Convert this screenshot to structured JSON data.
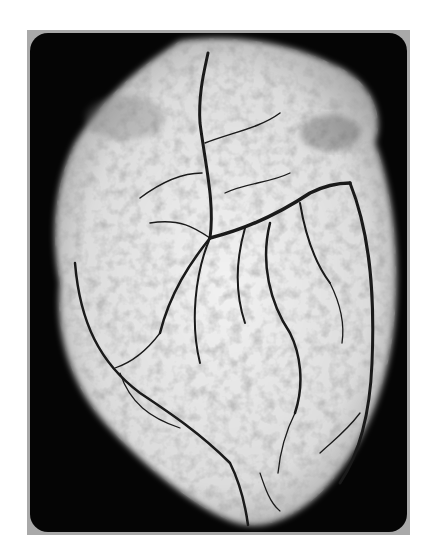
{
  "image": {
    "subject": "Radiograph of a heart showing contrast-filled coronary arteries",
    "alt": "Black-and-white X-ray angiogram of an excised heart with branching coronary vessels",
    "colors": {
      "frame": "#a9a9a9",
      "background": "#050505",
      "tissue": "#e6e6e6",
      "vessel": "#1a1a1a"
    }
  }
}
